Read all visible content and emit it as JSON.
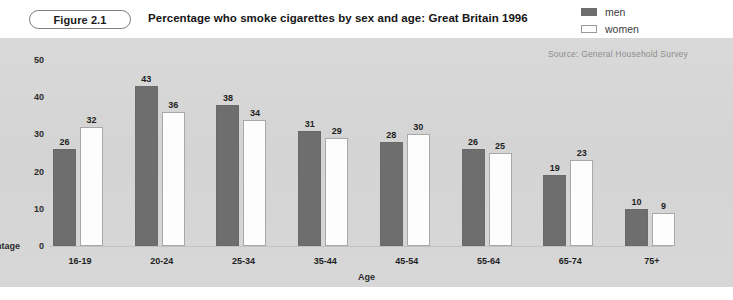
{
  "figure": {
    "badge": "Figure 2.1",
    "title": "Percentage who smoke cigarettes by sex and age: Great Britain 1996",
    "source": "Source: General Household Survey"
  },
  "legend": {
    "position": "top-right",
    "entries": [
      {
        "label": "men",
        "color": "#6e6e6e",
        "style": "filled"
      },
      {
        "label": "women",
        "color": "#ffffff",
        "style": "outline"
      }
    ]
  },
  "colors": {
    "panel_background": "#d6d6d6",
    "men_bar": "#6e6e6e",
    "women_bar": "#ffffff",
    "women_bar_border": "#a8a8a8",
    "text": "#1e1e1e",
    "source_text": "#8d8d8d"
  },
  "axis": {
    "y_title": "centage",
    "y_title_full": "Percentage",
    "x_title": "Age",
    "y_ticks": [
      "0",
      "10",
      "20",
      "30",
      "40",
      "50"
    ]
  },
  "chart_data": {
    "type": "bar",
    "title": "Percentage who smoke cigarettes by sex and age: Great Britain 1996",
    "subtitle": "Figure 2.1",
    "xlabel": "Age",
    "ylabel": "Percentage",
    "ylim": [
      0,
      50
    ],
    "yticks": [
      0,
      10,
      20,
      30,
      40,
      50
    ],
    "grid": false,
    "legend_position": "top-right",
    "annotations": [
      "Source: General Household Survey"
    ],
    "data_labels": true,
    "categories": [
      "16-19",
      "20-24",
      "25-34",
      "35-44",
      "45-54",
      "55-64",
      "65-74",
      "75+"
    ],
    "series": [
      {
        "name": "men",
        "values": [
          26,
          43,
          38,
          31,
          28,
          26,
          19,
          10
        ]
      },
      {
        "name": "women",
        "values": [
          32,
          36,
          34,
          29,
          30,
          25,
          23,
          9
        ]
      }
    ]
  }
}
